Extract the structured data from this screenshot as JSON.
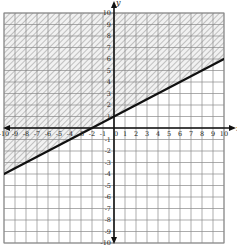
{
  "chart_data": {
    "type": "line",
    "title": "",
    "xlabel": "x",
    "ylabel": "y",
    "xlim": [
      -10,
      10
    ],
    "ylim": [
      -10,
      10
    ],
    "grid": true,
    "grid_step": 1,
    "x_ticks": [
      -10,
      -9,
      -8,
      -7,
      -6,
      -5,
      -4,
      -3,
      -2,
      -1,
      0,
      1,
      2,
      3,
      4,
      5,
      6,
      7,
      8,
      9,
      10
    ],
    "y_ticks": [
      -10,
      -9,
      -8,
      -7,
      -6,
      -5,
      -4,
      -3,
      -2,
      -1,
      1,
      2,
      3,
      4,
      5,
      6,
      7,
      8,
      9,
      10
    ],
    "series": [
      {
        "name": "boundary line y = 1/2 x + 1",
        "style": "solid",
        "slope": 0.5,
        "intercept": 1,
        "x": [
          -10,
          0,
          10
        ],
        "y": [
          -4,
          1,
          6
        ]
      }
    ],
    "shaded_region": {
      "inequality": "y >= 1/2 x + 1",
      "side": "above",
      "pattern": "diagonal hatch"
    },
    "legend": null,
    "annotations": []
  },
  "colors": {
    "grid": "#8a8a8a",
    "axis": "#111111",
    "line": "#111111",
    "hatch": "#9a9a9a",
    "shade_fill": "#eeeeee"
  }
}
